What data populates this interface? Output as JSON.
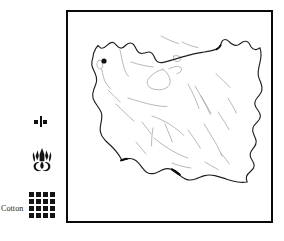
{
  "figure": {
    "kind": "thematic-map",
    "frame_color": "#0a0a0a",
    "background_color": "#ffffff"
  },
  "legend": {
    "items": [
      {
        "icon": "house-icon",
        "icon_kind": "house",
        "label": ""
      },
      {
        "icon": "emblem-icon",
        "icon_kind": "emblem",
        "label": ""
      },
      {
        "icon": "cotton-grid-icon",
        "icon_kind": "grid",
        "label": "Cotton"
      }
    ]
  },
  "map": {
    "name": "Iran",
    "outline_color": "#1a1a1a",
    "inland_color": "#9a9a9a",
    "markers": [
      {
        "name": "capital-marker",
        "color": "#111111",
        "x": 36,
        "y": 49
      }
    ]
  }
}
